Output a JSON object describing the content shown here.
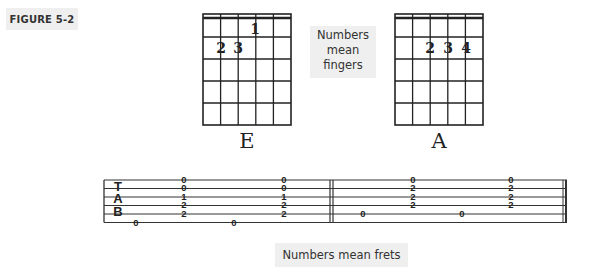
{
  "figure_label": "FIGURE 5-2",
  "notes": {
    "fingers_line1": "Numbers",
    "fingers_line2": "mean",
    "fingers_line3": "fingers",
    "frets": "Numbers mean frets"
  },
  "chords": [
    {
      "name": "E",
      "fingers": [
        {
          "string": 2,
          "fret": 2,
          "finger": "2"
        },
        {
          "string": 3,
          "fret": 2,
          "finger": "3"
        },
        {
          "string": 4,
          "fret": 1,
          "finger": "1"
        }
      ]
    },
    {
      "name": "A",
      "fingers": [
        {
          "string": 3,
          "fret": 2,
          "finger": "2"
        },
        {
          "string": 4,
          "fret": 2,
          "finger": "3"
        },
        {
          "string": 5,
          "fret": 2,
          "finger": "4"
        }
      ]
    }
  ],
  "tab": {
    "letters": [
      "T",
      "A",
      "B"
    ],
    "measures": [
      {
        "events": [
          {
            "type": "single",
            "string": 6,
            "fret": "0"
          },
          {
            "type": "chord",
            "frets": [
              "0",
              "0",
              "1",
              "2",
              "2"
            ]
          },
          {
            "type": "single",
            "string": 6,
            "fret": "0"
          },
          {
            "type": "chord",
            "frets": [
              "0",
              "0",
              "1",
              "2",
              "2"
            ]
          }
        ]
      },
      {
        "events": [
          {
            "type": "single",
            "string": 5,
            "fret": "0"
          },
          {
            "type": "chord",
            "frets": [
              "0",
              "2",
              "2",
              "2"
            ]
          },
          {
            "type": "single",
            "string": 5,
            "fret": "0"
          },
          {
            "type": "chord",
            "frets": [
              "0",
              "2",
              "2",
              "2"
            ]
          }
        ]
      }
    ]
  }
}
